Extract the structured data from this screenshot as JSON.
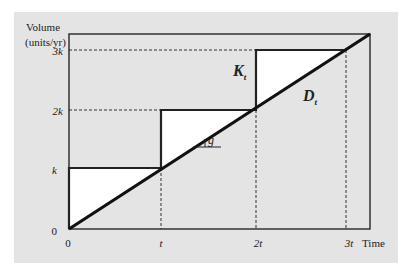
{
  "figure": {
    "y_axis_label_line1": "Volume",
    "y_axis_label_line2": "(units/yr)",
    "x_axis_label": "Time",
    "y_ticks": [
      "0",
      "k",
      "2k",
      "3k"
    ],
    "x_ticks": [
      "0",
      "t",
      "2t",
      "3t"
    ],
    "labels": {
      "capacity": "K",
      "capacity_sub": "t",
      "demand": "D",
      "demand_sub": "t",
      "growth": "g"
    }
  },
  "diagram_data": {
    "type": "capacity-expansion-step-vs-linear-demand",
    "demand_line": {
      "from": [
        0,
        0
      ],
      "to": [
        3,
        3
      ],
      "label": "D_t",
      "slope_label": "g"
    },
    "capacity_steps": [
      {
        "t_start": 0,
        "t_end": 1,
        "level": 1
      },
      {
        "t_start": 1,
        "t_end": 2,
        "level": 2
      },
      {
        "t_start": 2,
        "t_end": 3,
        "level": 3
      }
    ],
    "capacity_label": "K_t",
    "x_units": "t",
    "y_units": "k"
  },
  "colors": {
    "panel_bg": "#e4e4e4",
    "excess_capacity_fill": "#ffffff",
    "line": "#111111"
  }
}
